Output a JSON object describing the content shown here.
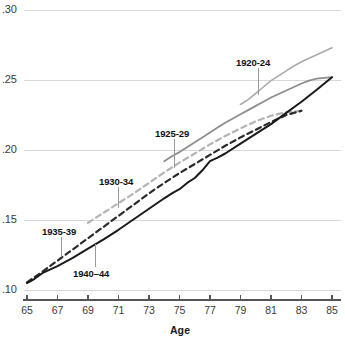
{
  "chart_data": {
    "type": "line",
    "title": "",
    "subtitle": "",
    "xlabel": "Age",
    "ylabel": "",
    "xlim": [
      65,
      85
    ],
    "ylim": [
      0.1,
      0.3
    ],
    "grid": true,
    "legend_position": "inline-annotations",
    "xticks": [
      "65",
      "67",
      "69",
      "71",
      "73",
      "75",
      "77",
      "79",
      "81",
      "83",
      "85"
    ],
    "xtick_values": [
      65,
      67,
      69,
      71,
      73,
      75,
      77,
      79,
      81,
      83,
      85
    ],
    "yticks": [
      ".10",
      ".15",
      ".20",
      ".25",
      ".30"
    ],
    "ytick_values": [
      0.1,
      0.15,
      0.2,
      0.25,
      0.3
    ],
    "series": [
      {
        "name": "1920-24",
        "style": "solid",
        "color": "#aaaaaa",
        "width": 1.6,
        "x": [
          79.0,
          79.5,
          80.0,
          80.5,
          81.0,
          81.5,
          82.0,
          82.5,
          83.0,
          83.5,
          84.0,
          84.5,
          85.0
        ],
        "values": [
          0.2325,
          0.236,
          0.2405,
          0.245,
          0.2495,
          0.253,
          0.2565,
          0.26,
          0.263,
          0.2655,
          0.268,
          0.2705,
          0.273
        ]
      },
      {
        "name": "1925-29",
        "style": "solid",
        "color": "#8e8e8e",
        "width": 1.8,
        "x": [
          74.0,
          74.5,
          75.0,
          75.5,
          76.0,
          76.5,
          77.0,
          77.5,
          78.0,
          78.5,
          79.0,
          79.5,
          80.0,
          80.5,
          81.0,
          81.5,
          82.0,
          82.5,
          83.0,
          83.5,
          84.0,
          84.5,
          85.0
        ],
        "values": [
          0.192,
          0.1955,
          0.1985,
          0.202,
          0.2055,
          0.209,
          0.2125,
          0.216,
          0.2195,
          0.2225,
          0.2255,
          0.2285,
          0.2315,
          0.2345,
          0.2375,
          0.24,
          0.2425,
          0.245,
          0.2475,
          0.2495,
          0.251,
          0.2515,
          0.252
        ]
      },
      {
        "name": "1930-34",
        "style": "dashed",
        "color": "#b4b4b4",
        "width": 2.2,
        "x": [
          69.0,
          70.0,
          71.0,
          72.0,
          73.0,
          74.0,
          75.0,
          76.0,
          77.0,
          78.0,
          79.0,
          80.0,
          81.0,
          82.0,
          83.0
        ],
        "values": [
          0.148,
          0.155,
          0.162,
          0.169,
          0.1765,
          0.184,
          0.191,
          0.1975,
          0.204,
          0.21,
          0.2155,
          0.2205,
          0.2245,
          0.227,
          0.228
        ]
      },
      {
        "name": "1935-39",
        "style": "dashed",
        "color": "#2a2a2a",
        "width": 2.2,
        "x": [
          65.0,
          66.0,
          67.0,
          68.0,
          69.0,
          70.0,
          71.0,
          72.0,
          73.0,
          74.0,
          75.0,
          76.0,
          77.0,
          78.0,
          79.0,
          80.0,
          81.0,
          82.0,
          83.0
        ],
        "values": [
          0.1055,
          0.113,
          0.121,
          0.129,
          0.137,
          0.145,
          0.153,
          0.161,
          0.169,
          0.1765,
          0.1835,
          0.19,
          0.1965,
          0.203,
          0.209,
          0.2145,
          0.22,
          0.225,
          0.228
        ]
      },
      {
        "name": "1940-44",
        "style": "solid",
        "color": "#1a1a1a",
        "width": 2.0,
        "x": [
          65.0,
          65.5,
          66.0,
          66.5,
          67.0,
          68.0,
          69.0,
          70.0,
          71.0,
          72.0,
          73.0,
          74.0,
          74.5,
          75.0,
          75.5,
          76.0,
          76.5,
          77.0,
          77.5,
          78.0,
          79.0,
          80.0,
          81.0,
          82.0,
          83.0,
          84.0,
          85.0
        ],
        "values": [
          0.105,
          0.108,
          0.112,
          0.1145,
          0.117,
          0.123,
          0.1295,
          0.136,
          0.143,
          0.1505,
          0.158,
          0.1655,
          0.169,
          0.172,
          0.1765,
          0.18,
          0.1855,
          0.192,
          0.1945,
          0.1975,
          0.2045,
          0.2115,
          0.2185,
          0.2265,
          0.2345,
          0.243,
          0.252
        ]
      }
    ],
    "annotations": [
      {
        "label": "1920-24",
        "label_x": 236,
        "label_y": 58,
        "leader_x": 258,
        "leader_y1": 68,
        "leader_y2": 95
      },
      {
        "label": "1925-29",
        "label_x": 155,
        "label_y": 129,
        "leader_x": 174,
        "leader_y1": 139,
        "leader_y2": 168
      },
      {
        "label": "1930-34",
        "label_x": 99,
        "label_y": 177,
        "leader_x": 118,
        "leader_y1": 187,
        "leader_y2": 208
      },
      {
        "label": "1935-39",
        "label_x": 42,
        "label_y": 227,
        "leader_x": 61,
        "leader_y1": 237,
        "leader_y2": 257
      },
      {
        "label": "1940–44",
        "label_x": 73,
        "label_y": 269,
        "leader_x": 95,
        "leader_y1": 267,
        "leader_y2": 244
      }
    ]
  },
  "axes": {
    "x_title": "Age"
  },
  "colors": {
    "gridline": "#d8d8d8",
    "axis_line": "#555555",
    "tick_text": "#3a3a3a",
    "label_text": "#111111",
    "leader_line": "#9a9a9a"
  }
}
